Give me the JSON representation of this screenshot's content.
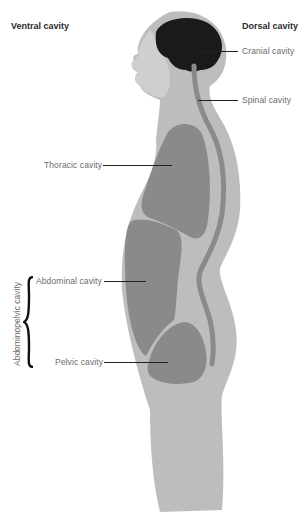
{
  "headings": {
    "ventral": "Ventral cavity",
    "dorsal": "Dorsal cavity"
  },
  "labels": {
    "cranial": "Cranial cavity",
    "spinal": "Spinal cavity",
    "thoracic": "Thoracic cavity",
    "abdominal": "Abdominal cavity",
    "pelvic": "Pelvic cavity",
    "abdominopelvic": "Abdominopelvic cavity"
  },
  "colors": {
    "body": "#bdbdbd",
    "cavity": "#8a8a8a",
    "brain": "#1a1a1a",
    "leader": "#222222",
    "label_text": "#6b6b6b",
    "heading_text": "#2b2b2b"
  }
}
